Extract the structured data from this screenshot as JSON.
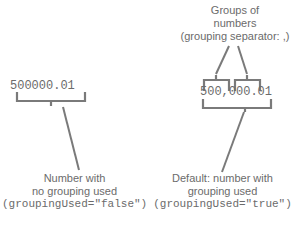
{
  "diagram": {
    "title_annotation": {
      "line1": "Groups of",
      "line2": "numbers",
      "line3": "(grouping separator: ,)"
    },
    "left_example": {
      "number": "500000.01",
      "caption_line1": "Number with",
      "caption_line2": "no grouping used",
      "caption_code": "(groupingUsed=\"false\")"
    },
    "right_example": {
      "number": "500,000.01",
      "caption_line1": "Default: number with",
      "caption_line2": "grouping used",
      "caption_code": "(groupingUsed=\"true\")"
    },
    "colors": {
      "ink": "#6b6b6b",
      "line": "#7a7a7a",
      "background": "#ffffff"
    }
  }
}
